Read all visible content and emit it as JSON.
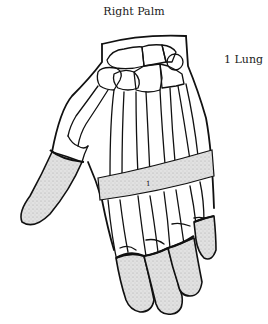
{
  "diagram": {
    "title": "Right Palm",
    "label": "1 Lung",
    "band_marker": "1",
    "highlighted_regions": [
      "thumb distal segment",
      "finger tips",
      "mid-palm band"
    ],
    "colors": {
      "line": "#111111",
      "shade": "#d6d6d6",
      "background": "#ffffff"
    }
  }
}
